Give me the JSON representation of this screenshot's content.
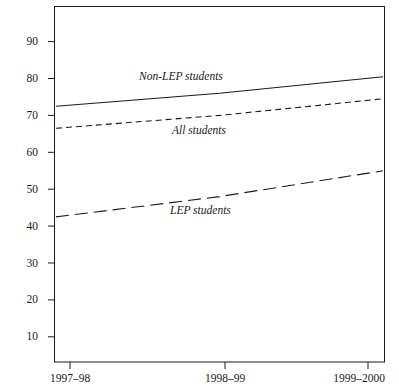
{
  "chart_data": {
    "type": "line",
    "title": "",
    "subtitle": "",
    "xlabel": "",
    "ylabel": "",
    "categories": [
      "1997–98",
      "1998–99",
      "1999–2000"
    ],
    "x_tick_labels": [
      "1997–98",
      "1998–99",
      "1999–2000"
    ],
    "y_tick_labels": [
      "10",
      "20",
      "30",
      "40",
      "50",
      "60",
      "70",
      "80",
      "90"
    ],
    "y_ticks": [
      10,
      20,
      30,
      40,
      50,
      60,
      70,
      80,
      90
    ],
    "ylim": [
      0,
      95
    ],
    "grid": false,
    "legend_position": "inline-annotations",
    "series": [
      {
        "name": "Non-LEP students",
        "label": "Non-LEP students",
        "style": "solid",
        "color": "#1a1a1a",
        "values": [
          72.5,
          76.0,
          80.5
        ]
      },
      {
        "name": "All students",
        "label": "All students",
        "style": "short-dashed",
        "color": "#1a1a1a",
        "values": [
          66.5,
          70.0,
          74.5
        ]
      },
      {
        "name": "LEP students",
        "label": "LEP students",
        "style": "long-dashed",
        "color": "#1a1a1a",
        "values": [
          42.5,
          48.0,
          55.0
        ]
      }
    ],
    "annotations": [
      {
        "text": "Non-LEP students",
        "series": "Non-LEP students"
      },
      {
        "text": "All students",
        "series": "All students"
      },
      {
        "text": "LEP students",
        "series": "LEP students"
      }
    ]
  },
  "axes": {
    "frame_color": "#1a1a1a",
    "tick_color": "#1a1a1a"
  }
}
